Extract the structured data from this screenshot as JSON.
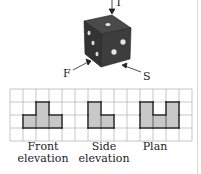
{
  "figure": {
    "view_labels": {
      "top": "T",
      "front": "F",
      "side": "S"
    },
    "die": {
      "color": "#3a3a3a",
      "pip_color": "#e8e8e8"
    },
    "grid": {
      "columns": 14,
      "rows": 4,
      "cell_size": 13,
      "origin": [
        10,
        89
      ],
      "line_color": "#b8b8b8",
      "fill_color": "#c8c8c8",
      "outline_color": "#222222"
    },
    "views": [
      {
        "name": "Front elevation",
        "caption_line1": "Front",
        "caption_line2": "elevation",
        "cells": [
          [
            1,
            2
          ],
          [
            2,
            1
          ],
          [
            2,
            2
          ],
          [
            3,
            2
          ]
        ]
      },
      {
        "name": "Side elevation",
        "caption_line1": "Side",
        "caption_line2": "elevation",
        "cells": [
          [
            6,
            1
          ],
          [
            6,
            2
          ],
          [
            7,
            2
          ]
        ]
      },
      {
        "name": "Plan",
        "caption_line1": "Plan",
        "caption_line2": "",
        "cells": [
          [
            10,
            1
          ],
          [
            10,
            2
          ],
          [
            11,
            2
          ],
          [
            12,
            1
          ],
          [
            12,
            2
          ]
        ]
      }
    ]
  }
}
